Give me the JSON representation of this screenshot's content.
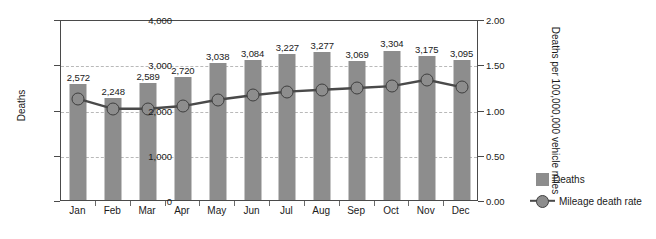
{
  "chart_data": {
    "type": "bar",
    "title": "",
    "xlabel": "",
    "ylabel": "Deaths",
    "y2label": "Deaths per 100,000,000 vehicle miles",
    "categories": [
      "Jan",
      "Feb",
      "Mar",
      "Apr",
      "May",
      "Jun",
      "Jul",
      "Aug",
      "Sep",
      "Oct",
      "Nov",
      "Dec"
    ],
    "ylim": [
      0,
      4000
    ],
    "y2lim": [
      0,
      2.0
    ],
    "yticks": [
      0,
      1000,
      2000,
      3000,
      4000
    ],
    "ytick_labels": [
      "0",
      "1,000",
      "2,000",
      "3,000",
      "4,000"
    ],
    "y2ticks": [
      0,
      0.5,
      1.0,
      1.5,
      2.0
    ],
    "y2tick_labels": [
      "0.00",
      "0.50",
      "1.00",
      "1.50",
      "2.00"
    ],
    "grid": true,
    "legend_position": "right",
    "series": [
      {
        "name": "Deaths",
        "kind": "bar",
        "axis": "left",
        "color": "#8d8d8d",
        "values": [
          2572,
          2248,
          2589,
          2720,
          3038,
          3084,
          3227,
          3277,
          3069,
          3304,
          3175,
          3095
        ],
        "value_labels": [
          "2,572",
          "2,248",
          "2,589",
          "2,720",
          "3,038",
          "3,084",
          "3,227",
          "3,277",
          "3,069",
          "3,304",
          "3,175",
          "3,095"
        ]
      },
      {
        "name": "Mileage death rate",
        "kind": "line",
        "axis": "right",
        "color": "#4a4a4a",
        "marker": "circle",
        "values": [
          1.14,
          1.03,
          1.03,
          1.06,
          1.13,
          1.18,
          1.22,
          1.24,
          1.26,
          1.28,
          1.35,
          1.27
        ]
      }
    ]
  },
  "legend": {
    "items": [
      {
        "label": "Deaths",
        "type": "swatch"
      },
      {
        "label": "Mileage death rate",
        "type": "line-marker"
      }
    ]
  },
  "colors": {
    "bar": "#8d8d8d",
    "line": "#4a4a4a",
    "marker_fill": "#8d8d8d",
    "marker_edge": "#3f3f3f",
    "grid": "#b9b9b9",
    "axis": "#4a4a4a",
    "text": "#1a1a1a"
  }
}
